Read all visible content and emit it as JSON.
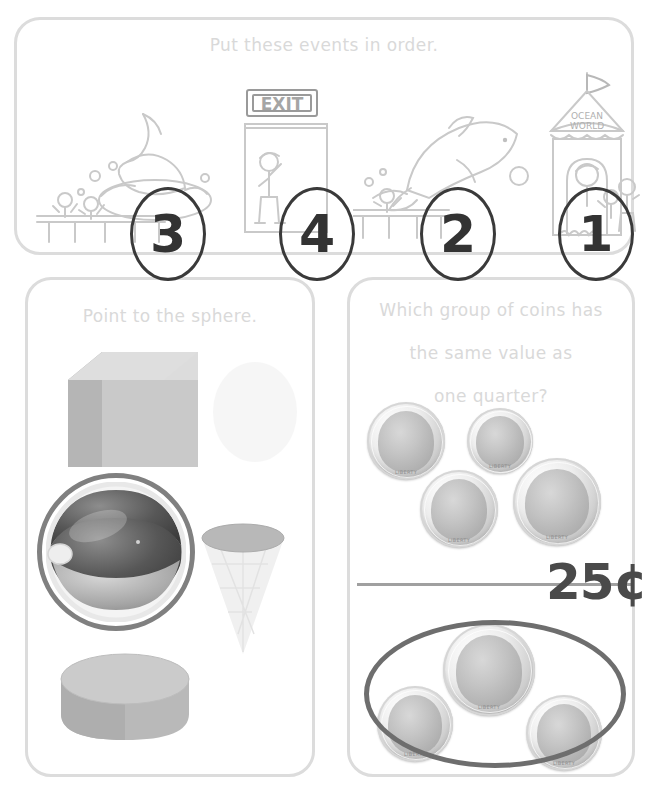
{
  "page": {
    "background_color": "#ffffff",
    "panel_border_color": "#dcdcdc",
    "title_color": "#d9d9d9",
    "ink_color": "#333333"
  },
  "panels": {
    "events": {
      "title": "Put these events in order.",
      "scenes": [
        {
          "name": "whale-splash",
          "description": "whale breaching with splash, children watching from dock",
          "answer_number": "3"
        },
        {
          "name": "exit-door",
          "description": "child walking out an EXIT door",
          "sign_text": "EXIT",
          "answer_number": "4"
        },
        {
          "name": "dolphin-jump",
          "description": "dolphin leaping over water with ball, child on dock",
          "answer_number": "2"
        },
        {
          "name": "ticket-booth",
          "description": "Ocean World ticket booth with flag and children buying tickets",
          "sign_text_line1": "OCEAN",
          "sign_text_line2": "WORLD",
          "answer_number": "1"
        }
      ]
    },
    "shapes": {
      "title": "Point to the sphere.",
      "items": [
        {
          "name": "cube",
          "label": "cube",
          "selected": false
        },
        {
          "name": "sphere",
          "label": "beach ball sphere",
          "selected": true
        },
        {
          "name": "cone",
          "label": "ice cream cone",
          "selected": false
        },
        {
          "name": "cylinder",
          "label": "cylinder disk",
          "selected": false
        }
      ],
      "selection_ring_color": "#808080"
    },
    "coins": {
      "title_line1": "Which group of coins has",
      "title_line2": "the same value as",
      "title_line3": "one quarter?",
      "value_label": "25¢",
      "groups": [
        {
          "name": "group-one",
          "selected": false,
          "coins": [
            {
              "type": "penny",
              "label": "LIBERTY"
            },
            {
              "type": "dime",
              "label": "LIBERTY"
            },
            {
              "type": "penny",
              "label": "LIBERTY"
            },
            {
              "type": "nickel",
              "label": "LIBERTY"
            }
          ]
        },
        {
          "name": "group-two",
          "selected": true,
          "coins": [
            {
              "type": "nickel",
              "label": "LIBERTY"
            },
            {
              "type": "dime",
              "label": "LIBERTY"
            },
            {
              "type": "dime",
              "label": "LIBERTY"
            }
          ]
        }
      ],
      "selection_ring_color": "#6e6e6e"
    }
  }
}
